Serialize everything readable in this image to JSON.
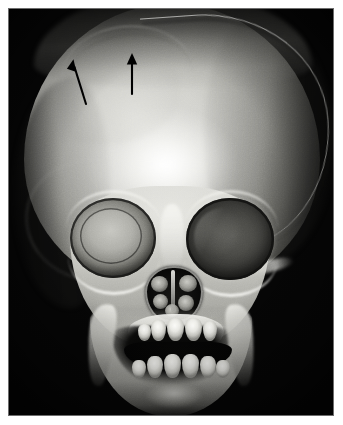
{
  "figure": {
    "kind": "medical-image",
    "modality": "3D CT volume-rendered reconstruction",
    "view": "frontal (anteroposterior)",
    "caption": "",
    "background_color": "#050505",
    "page_color": "#ffffff",
    "panel": {
      "x": 8,
      "y": 8,
      "width": 326,
      "height": 408,
      "border_color": "#6d6d6d"
    }
  },
  "annotations": [
    {
      "id": "arrow-left",
      "name": "annotation-arrow-left",
      "glyph": "arrow",
      "color": "#000000",
      "orientation": "up-left diagonal",
      "tip": {
        "x": 64,
        "y": 54
      },
      "tail": {
        "x": 78,
        "y": 96
      },
      "points_to": "frontal bone ridge"
    },
    {
      "id": "arrow-right",
      "name": "annotation-arrow-right",
      "glyph": "arrow",
      "color": "#000000",
      "orientation": "vertical up",
      "tip": {
        "x": 124,
        "y": 47
      },
      "tail": {
        "x": 124,
        "y": 86
      },
      "points_to": "frontal bone ridge"
    }
  ],
  "anatomy": [
    {
      "name": "calvarium",
      "label": "cranial vault"
    },
    {
      "name": "coronal-suture",
      "label": "coronal suture"
    },
    {
      "name": "frontal-ridge",
      "label": "frontal bone ridge"
    },
    {
      "name": "orbit-right",
      "label": "right orbit"
    },
    {
      "name": "orbit-left",
      "label": "left orbit"
    },
    {
      "name": "nasal-aperture",
      "label": "piriform nasal aperture"
    },
    {
      "name": "maxilla",
      "label": "maxilla"
    },
    {
      "name": "mandible",
      "label": "mandible"
    },
    {
      "name": "upper-teeth",
      "label": "upper deciduous teeth"
    },
    {
      "name": "lower-teeth",
      "label": "lower deciduous teeth"
    }
  ],
  "teeth": {
    "upper": [
      {
        "x": 130,
        "y": 316,
        "w": 13,
        "h": 17
      },
      {
        "x": 143,
        "y": 312,
        "w": 15,
        "h": 21
      },
      {
        "x": 159,
        "y": 310,
        "w": 17,
        "h": 23
      },
      {
        "x": 177,
        "y": 310,
        "w": 17,
        "h": 23
      },
      {
        "x": 195,
        "y": 313,
        "w": 14,
        "h": 20
      }
    ],
    "lower": [
      {
        "x": 124,
        "y": 352,
        "w": 14,
        "h": 18
      },
      {
        "x": 139,
        "y": 348,
        "w": 16,
        "h": 22
      },
      {
        "x": 156,
        "y": 346,
        "w": 17,
        "h": 24
      },
      {
        "x": 174,
        "y": 346,
        "w": 17,
        "h": 24
      },
      {
        "x": 192,
        "y": 348,
        "w": 16,
        "h": 22
      },
      {
        "x": 208,
        "y": 352,
        "w": 14,
        "h": 18
      }
    ]
  },
  "turbinates": [
    {
      "x": 6,
      "y": 10,
      "w": 17,
      "h": 16
    },
    {
      "x": 34,
      "y": 9,
      "w": 18,
      "h": 17
    },
    {
      "x": 8,
      "y": 28,
      "w": 15,
      "h": 15
    },
    {
      "x": 33,
      "y": 29,
      "w": 16,
      "h": 16
    },
    {
      "x": 20,
      "y": 38,
      "w": 14,
      "h": 13
    }
  ]
}
